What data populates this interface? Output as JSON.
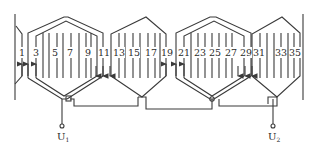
{
  "diagram": {
    "type": "stator-winding-expanded-diagram",
    "slot_labels": [
      "1",
      "3",
      "5",
      "7",
      "9",
      "11",
      "13",
      "15",
      "17",
      "19",
      "21",
      "23",
      "25",
      "27",
      "29",
      "31",
      "33",
      "35"
    ],
    "terminals": {
      "start": {
        "label": "U",
        "subscript": "1"
      },
      "end": {
        "label": "U",
        "subscript": "2"
      }
    },
    "coil_groups": [
      {
        "name": "group-1",
        "slots": [
          "1",
          "3",
          "9",
          "11"
        ],
        "style": "double-concentric"
      },
      {
        "name": "group-2",
        "slots": [
          "11",
          "19"
        ],
        "style": "single"
      },
      {
        "name": "group-3",
        "slots": [
          "19",
          "21",
          "27",
          "29"
        ],
        "style": "double-concentric"
      },
      {
        "name": "group-4",
        "slots": [
          "29",
          "37"
        ],
        "style": "single"
      }
    ],
    "colors": {
      "line": "#3a3a3a",
      "background": "#ffffff"
    }
  }
}
